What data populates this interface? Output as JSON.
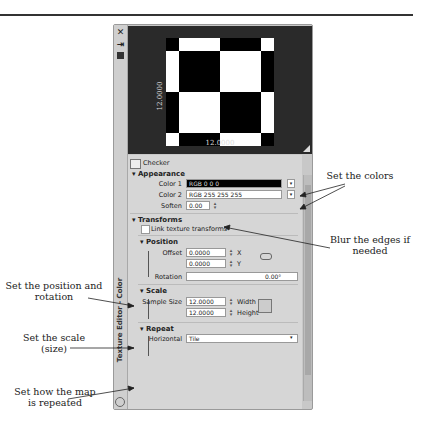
{
  "panel": {
    "title": "Texture Editor - Color",
    "strip_icons": [
      "close-icon",
      "dock-icon",
      "color-swatch-icon"
    ],
    "preview": {
      "width_label": "12.0000",
      "height_label": "12.0000"
    },
    "texture_name": "Checker",
    "appearance": {
      "header": "Appearance",
      "color1_label": "Color 1",
      "color1_value": "RGB 0 0 0",
      "color2_label": "Color 2",
      "color2_value": "RGB 255 255 255",
      "soften_label": "Soften",
      "soften_value": "0.00"
    },
    "transforms": {
      "header": "Transforms",
      "link_label": "Link texture transforms"
    },
    "position": {
      "header": "Position",
      "offset_label": "Offset",
      "offset_x": "0.0000",
      "x_label": "X",
      "offset_y": "0.0000",
      "y_label": "Y",
      "rotation_label": "Rotation",
      "rotation_value": "0.00°"
    },
    "scale": {
      "header": "Scale",
      "sample_label": "Sample Size",
      "width_value": "12.0000",
      "width_label": "Width",
      "height_value": "12.0000",
      "height_label": "Height"
    },
    "repeat": {
      "header": "Repeat",
      "horizontal_label": "Horizontal",
      "horizontal_value": "Tile"
    }
  },
  "annotations": {
    "colors": "Set the colors",
    "blur": "Blur the edges if needed",
    "position": "Set the position and rotation",
    "scale": "Set the scale (size)",
    "repeat": "Set how the map is repeated"
  }
}
